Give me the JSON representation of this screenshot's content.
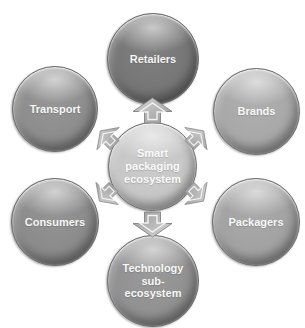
{
  "figure": {
    "title": "Smart packaging ecosystem",
    "center_node": {
      "label": "Smart packaging ecosystem",
      "fill": "#c7c7c7"
    },
    "nodes": [
      {
        "id": "retailers",
        "label": "Retailers",
        "fill": "#767676",
        "position": "top"
      },
      {
        "id": "brands",
        "label": "Brands",
        "fill": "#a8a8a8",
        "position": "top-right"
      },
      {
        "id": "packagers",
        "label": "Packagers",
        "fill": "#a2a2a2",
        "position": "bottom-right"
      },
      {
        "id": "technology",
        "label": "Technology sub-ecosystem",
        "fill": "#919191",
        "position": "bottom"
      },
      {
        "id": "consumers",
        "label": "Consumers",
        "fill": "#8b8b8b",
        "position": "bottom-left"
      },
      {
        "id": "transport",
        "label": "Transport",
        "fill": "#8d8d8d",
        "position": "top-left"
      }
    ],
    "arrows": [
      {
        "direction": "up",
        "to": "Retailers"
      },
      {
        "direction": "up-right",
        "to": "Brands"
      },
      {
        "direction": "down-right",
        "to": "Packagers"
      },
      {
        "direction": "down",
        "to": "Technology sub-ecosystem"
      },
      {
        "direction": "down-left",
        "to": "Consumers"
      },
      {
        "direction": "up-left",
        "to": "Transport"
      }
    ],
    "arrow_colors": {
      "light": "#d6d6d6",
      "dark": "#9b9b9b",
      "outline": "#8a8a8a"
    }
  }
}
